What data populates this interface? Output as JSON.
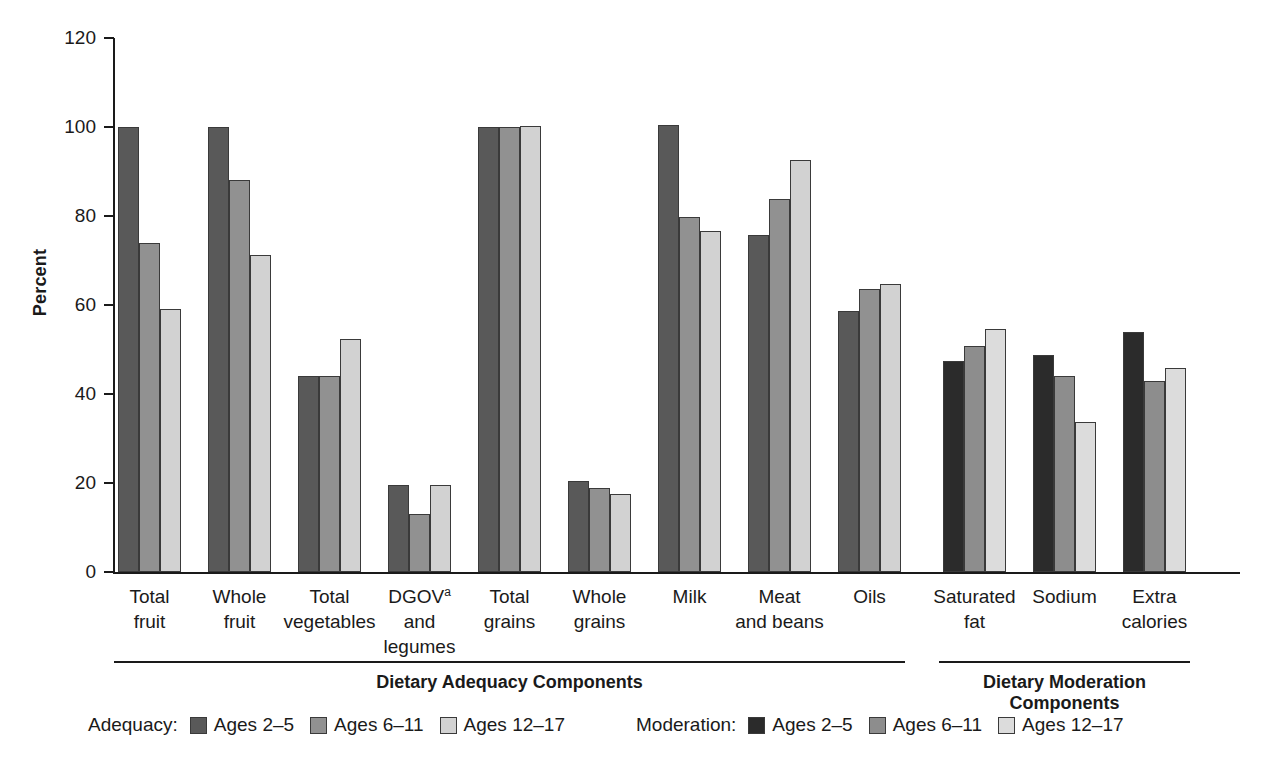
{
  "chart_data": {
    "type": "bar",
    "title": "",
    "xlabel": "",
    "ylabel": "Percent",
    "ylim": [
      0,
      120
    ],
    "yticks": [
      0,
      20,
      40,
      60,
      80,
      100,
      120
    ],
    "grid": false,
    "legend_position": "bottom",
    "categories": [
      "Total fruit",
      "Whole fruit",
      "Total vegetables",
      "DGOV and legumes",
      "Total grains",
      "Whole grains",
      "Milk",
      "Meat and beans",
      "Oils",
      "Saturated fat",
      "Sodium",
      "Extra calories"
    ],
    "series": [
      {
        "name": "Ages 2-5",
        "values": [
          100,
          100,
          44,
          19.5,
          100,
          20.5,
          100.5,
          75.8,
          58.7,
          47.5,
          48.8,
          54
        ]
      },
      {
        "name": "Ages 6-11",
        "values": [
          74,
          88,
          44,
          13,
          100,
          18.8,
          79.7,
          83.8,
          63.7,
          50.7,
          44,
          43
        ]
      },
      {
        "name": "Ages 12-17",
        "values": [
          59,
          71.2,
          52.3,
          19.6,
          100.3,
          17.5,
          76.7,
          92.5,
          64.8,
          54.7,
          33.8,
          45.8
        ]
      }
    ],
    "section_split_index": 9,
    "colors": {
      "adequacy": [
        "#595959",
        "#919191",
        "#d2d2d2"
      ],
      "moderation": [
        "#2b2b2b",
        "#8d8d8d",
        "#dcdcdc"
      ],
      "bar_border": "#3a3a3a",
      "axis": "#1a1a1a"
    }
  },
  "category_label_lines": [
    [
      "Total",
      "fruit"
    ],
    [
      "Whole",
      "fruit"
    ],
    [
      "Total",
      "vegetables"
    ],
    [
      "DGOV",
      "and",
      "legumes"
    ],
    [
      "Total",
      "grains"
    ],
    [
      "Whole",
      "grains"
    ],
    [
      "Milk"
    ],
    [
      "Meat",
      "and beans"
    ],
    [
      "Oils"
    ],
    [
      "Saturated",
      "fat"
    ],
    [
      "Sodium"
    ],
    [
      "Extra",
      "calories"
    ]
  ],
  "dgov_superscript": "a",
  "y_axis": {
    "label": "Percent",
    "tick_labels": [
      "120",
      "100",
      "80",
      "60",
      "40",
      "20",
      "0"
    ]
  },
  "sections": [
    {
      "title": "Dietary Adequacy Components"
    },
    {
      "title": "Dietary Moderation Components"
    }
  ],
  "legend": {
    "adequacy": {
      "group_label": "Adequacy:",
      "items": [
        {
          "label": "Ages 2–5",
          "color": "#595959"
        },
        {
          "label": "Ages 6–11",
          "color": "#919191"
        },
        {
          "label": "Ages 12–17",
          "color": "#d2d2d2"
        }
      ]
    },
    "moderation": {
      "group_label": "Moderation:",
      "items": [
        {
          "label": "Ages 2–5",
          "color": "#2b2b2b"
        },
        {
          "label": "Ages 6–11",
          "color": "#8d8d8d"
        },
        {
          "label": "Ages 12–17",
          "color": "#dcdcdc"
        }
      ]
    }
  }
}
